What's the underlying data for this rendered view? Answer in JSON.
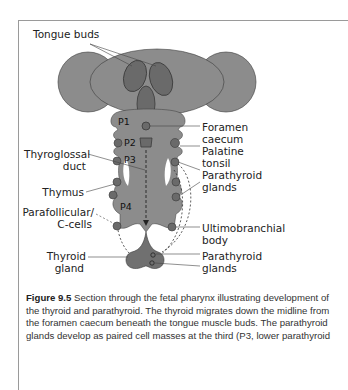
{
  "figure": {
    "labels": {
      "tongue_buds": "Tongue buds",
      "foramen_caecum_1": "Foramen",
      "foramen_caecum_2": "caecum",
      "palatine_tonsil_1": "Palatine",
      "palatine_tonsil_2": "tonsil",
      "parathyroid_glands_upper_1": "Parathyroid",
      "parathyroid_glands_upper_2": "glands",
      "thyroglossal_duct_1": "Thyroglossal",
      "thyroglossal_duct_2": "duct",
      "thymus": "Thymus",
      "parafollicular_1": "Parafollicular/",
      "parafollicular_2": "C-cells",
      "ultimobranchial_1": "Ultimobranchial",
      "ultimobranchial_2": "body",
      "thyroid_gland_1": "Thyroid",
      "thyroid_gland_2": "gland",
      "parathyroid_glands_lower_1": "Parathyroid",
      "parathyroid_glands_lower_2": "glands"
    },
    "pouches": [
      "P1",
      "P2",
      "P3",
      "P4"
    ],
    "colors": {
      "tissue": "#8c8c8c",
      "tissue_dark": "#6a6a6a",
      "outline": "#3a3a3a",
      "frame": "#9a9a9a"
    }
  },
  "caption": {
    "number": "Figure 9.5",
    "text": "Section through the fetal pharynx illustrating development of the thyroid and parathyroid. The thyroid migrates down the midline from the foramen caecum beneath the tongue muscle buds. The parathyroid glands develop as paired cell masses at the third (P3, lower parathyroid"
  }
}
